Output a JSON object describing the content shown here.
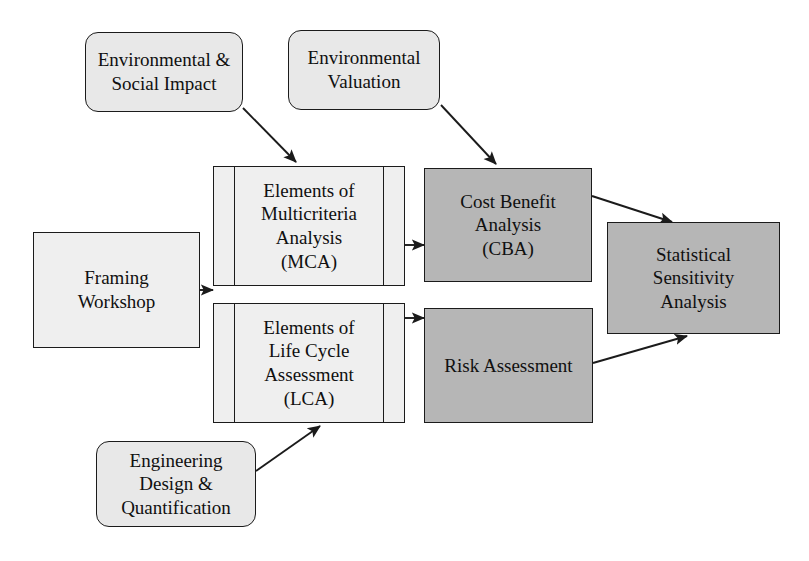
{
  "diagram": {
    "colors": {
      "shaded_fill": "#b6b6b6",
      "light_fill": "#efefef",
      "rounded_fill": "#e8e8e8",
      "stroke": "#1b1b1b",
      "background": "#ffffff"
    },
    "nodes": [
      {
        "id": "environmental-social-impact",
        "label": "Environmental &\nSocial Impact",
        "shape": "rounded-rectangle",
        "fill": "#e8e8e8",
        "x": 85,
        "y": 32,
        "w": 158,
        "h": 80
      },
      {
        "id": "environmental-valuation",
        "label": "Environmental\nValuation",
        "shape": "rounded-rectangle",
        "fill": "#e8e8e8",
        "x": 288,
        "y": 30,
        "w": 152,
        "h": 80
      },
      {
        "id": "framing-workshop",
        "label": "Framing\nWorkshop",
        "shape": "rectangle",
        "fill": "#efefef",
        "x": 33,
        "y": 232,
        "w": 167,
        "h": 116
      },
      {
        "id": "elements-of-mca",
        "label": "Elements of\nMulticriteria\nAnalysis\n(MCA)",
        "shape": "predefined-process",
        "fill": "#efefef",
        "x": 213,
        "y": 166,
        "w": 192,
        "h": 120
      },
      {
        "id": "elements-of-lca",
        "label": "Elements of\nLife Cycle\nAssessment\n(LCA)",
        "shape": "predefined-process",
        "fill": "#efefef",
        "x": 213,
        "y": 303,
        "w": 192,
        "h": 120
      },
      {
        "id": "cost-benefit-analysis",
        "label": "Cost Benefit\nAnalysis\n(CBA)",
        "shape": "rectangle",
        "fill": "#b6b6b6",
        "x": 424,
        "y": 168,
        "w": 168,
        "h": 114
      },
      {
        "id": "risk-assessment",
        "label": "Risk Assessment",
        "shape": "rectangle",
        "fill": "#b6b6b6",
        "x": 424,
        "y": 308,
        "w": 169,
        "h": 115
      },
      {
        "id": "statistical-sensitivity-analysis",
        "label": "Statistical\nSensitivity\nAnalysis",
        "shape": "rectangle",
        "fill": "#b6b6b6",
        "x": 607,
        "y": 222,
        "w": 173,
        "h": 112
      },
      {
        "id": "engineering-design-quantification",
        "label": "Engineering\nDesign &\nQuantification",
        "shape": "rounded-rectangle",
        "fill": "#e8e8e8",
        "x": 96,
        "y": 441,
        "w": 160,
        "h": 86
      }
    ],
    "edges": [
      {
        "id": "esi-to-mca",
        "from": "environmental-social-impact",
        "to": "elements-of-mca",
        "points": "243,108 295,163"
      },
      {
        "id": "ev-to-cba",
        "from": "environmental-valuation",
        "to": "cost-benefit-analysis",
        "points": "440,105 495,165"
      },
      {
        "id": "framing-to-analyses",
        "from": "framing-workshop",
        "to": "elements-of-mca",
        "points": "200,290 209,290"
      },
      {
        "id": "mca-to-cba",
        "from": "elements-of-mca",
        "to": "cost-benefit-analysis",
        "points": "405,245 420,245"
      },
      {
        "id": "lca-to-risk",
        "from": "elements-of-lca",
        "to": "risk-assessment",
        "points": "405,318 420,318"
      },
      {
        "id": "cba-to-ssa",
        "from": "cost-benefit-analysis",
        "to": "statistical-sensitivity-analysis",
        "points": "592,196 670,221"
      },
      {
        "id": "risk-to-ssa",
        "from": "risk-assessment",
        "to": "statistical-sensitivity-analysis",
        "points": "593,362 686,337"
      },
      {
        "id": "engineering-to-lca",
        "from": "engineering-design-quantification",
        "to": "elements-of-lca",
        "points": "256,470 319,427"
      }
    ]
  }
}
